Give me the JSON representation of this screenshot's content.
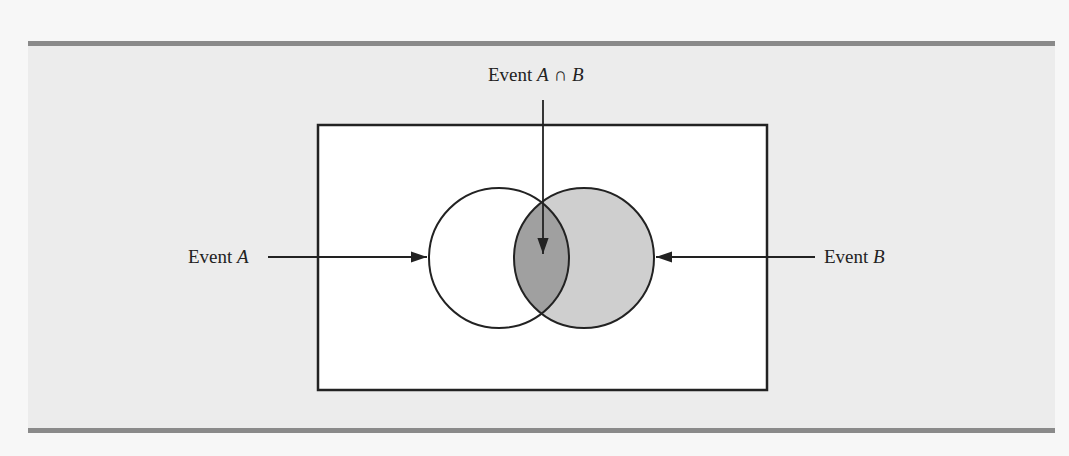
{
  "figure": {
    "type": "venn-diagram",
    "labels": {
      "event_a": "Event A",
      "event_b": "Event B",
      "intersection": "Event A ∩ B"
    },
    "label_parts": {
      "event_word": "Event ",
      "a": "A",
      "b": "B",
      "intersection_symbol": " ∩ "
    },
    "colors": {
      "background_panel": "#ececec",
      "sample_space_fill": "#ffffff",
      "circle_a_fill": "#ffffff",
      "circle_b_fill": "#cfcfcf",
      "intersection_fill": "#a0a0a0",
      "rule": "#8a8a8a",
      "stroke": "#222222"
    }
  }
}
